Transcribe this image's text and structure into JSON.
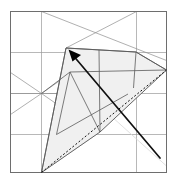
{
  "figure": {
    "title": "Origami crease pattern step",
    "kind": "origami-fold-diagram",
    "caption": "",
    "width": 177,
    "height": 186,
    "background": "#ffffff"
  },
  "colors": {
    "background": "#ffffff",
    "paper_fill": "#ffffff",
    "shaded_fill": "#f0f0f0",
    "shaded_stroke": "#555555",
    "grid_line": "#9a9a9a",
    "border_line": "#6e6e6e",
    "fold_bold": "#111111",
    "dotted_line": "#111111",
    "arrow": "#000000"
  },
  "square": {
    "label": "paper-outline",
    "left": 10.5,
    "top": 11.5,
    "right": 166.5,
    "bottom": 172.5
  },
  "grid": {
    "vertical_x": [
      41.5,
      136.5
    ],
    "horizontal_y": [
      52.5,
      93.5,
      134.5
    ],
    "note": "light construction grid inside the square"
  },
  "construction_lines": [
    {
      "name": "diag-topleft-node-to-right",
      "x1": 41.5,
      "y1": 11.5,
      "x2": 166.5,
      "y2": 60.5
    },
    {
      "name": "diag-topright-node-to-left",
      "x1": 136.5,
      "y1": 11.5,
      "x2": 70.0,
      "y2": 52.5
    },
    {
      "name": "diag-left-edge-to-center",
      "x1": 10.5,
      "y1": 72.5,
      "x2": 41.5,
      "y2": 93.5
    },
    {
      "name": "diag-center-to-left-edge-down",
      "x1": 41.5,
      "y1": 93.5,
      "x2": 10.5,
      "y2": 114.5
    },
    {
      "name": "diag-center-up-right",
      "x1": 41.5,
      "y1": 93.5,
      "x2": 72.0,
      "y2": 72.5
    },
    {
      "name": "diag-center-down-right",
      "x1": 41.5,
      "y1": 93.5,
      "x2": 72.0,
      "y2": 114.5
    },
    {
      "name": "vertical-through-center",
      "x1": 41.5,
      "y1": 52.5,
      "x2": 41.5,
      "y2": 134.5
    },
    {
      "name": "horizontal-through-center",
      "x1": 10.5,
      "y1": 93.5,
      "x2": 72.0,
      "y2": 93.5
    },
    {
      "name": "faint-diag-lower-right",
      "x1": 90.0,
      "y1": 93.5,
      "x2": 166.5,
      "y2": 160.0
    }
  ],
  "shaded_flap": {
    "name": "folded-flap",
    "points": "66,48 136,52 166,70 100,132 41,172",
    "fill": "#f0f0f0",
    "stroke": "#555555"
  },
  "flap_creases": [
    {
      "name": "crease-left-fold",
      "x1": 66.0,
      "y1": 48.0,
      "x2": 41.5,
      "y2": 172.5
    },
    {
      "name": "crease-upper-horizontal",
      "x1": 71.0,
      "y1": 72.5,
      "x2": 166.5,
      "y2": 70.0
    },
    {
      "name": "crease-mid-horizontal",
      "x1": 57.0,
      "y1": 134.5,
      "x2": 127.0,
      "y2": 95.0
    },
    {
      "name": "crease-vertical-a",
      "x1": 99.0,
      "y1": 50.0,
      "x2": 100.0,
      "y2": 132.0
    },
    {
      "name": "crease-vertical-b",
      "x1": 136.0,
      "y1": 52.0,
      "x2": 133.0,
      "y2": 90.0
    },
    {
      "name": "crease-diag-a",
      "x1": 71.0,
      "y1": 72.5,
      "x2": 100.0,
      "y2": 132.0
    },
    {
      "name": "crease-diag-b",
      "x1": 57.0,
      "y1": 134.5,
      "x2": 71.0,
      "y2": 72.5
    },
    {
      "name": "crease-edge-right",
      "x1": 136.0,
      "y1": 52.0,
      "x2": 166.5,
      "y2": 70.0
    },
    {
      "name": "crease-edge-top",
      "x1": 66.0,
      "y1": 48.0,
      "x2": 136.0,
      "y2": 52.0
    }
  ],
  "dotted_reference": {
    "name": "reference-diagonal",
    "x1": 41.5,
    "y1": 172.5,
    "x2": 166.5,
    "y2": 70.0,
    "dash": "2 2"
  },
  "bold_fold": {
    "name": "active-fold-line",
    "x1": 160.0,
    "y1": 158.0,
    "x2": 71.0,
    "y2": 53.0,
    "width": 1.8
  },
  "arrow": {
    "name": "fold-direction-arrow",
    "tip_x": 70.0,
    "tip_y": 51.0,
    "head": "71,50 80,55 73,60",
    "direction": "up-left",
    "label": ""
  },
  "legend": {
    "items": [
      {
        "name": "valley-fold",
        "label": "fold line"
      },
      {
        "name": "reference-line",
        "label": "reference (dotted)"
      },
      {
        "name": "grid",
        "label": "construction grid"
      }
    ]
  }
}
